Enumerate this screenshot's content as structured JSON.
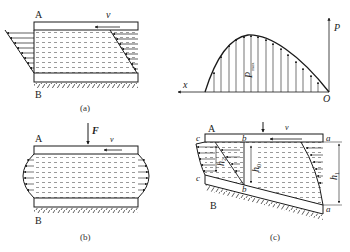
{
  "figure": {
    "panels": [
      {
        "id": "a",
        "caption": "(a)",
        "labels": {
          "upper": "A",
          "lower": "B",
          "velocity": "v"
        },
        "description": "Parallel plates, upper plate moving with velocity v; linear velocity distribution at inlet and outlet"
      },
      {
        "id": "pressure",
        "labels": {
          "x_axis": "x",
          "y_axis": "P",
          "origin": "O",
          "peak": "P_max",
          "peak_main": "P",
          "peak_sub": "max"
        },
        "description": "Pressure distribution along the wedge with peak P_max"
      },
      {
        "id": "b",
        "caption": "(b)",
        "labels": {
          "upper": "A",
          "lower": "B",
          "velocity": "v",
          "force": "F"
        },
        "description": "Squeeze film: load F pushes upper plate, parabolic outflow at both ends"
      },
      {
        "id": "c",
        "caption": "(c)",
        "labels": {
          "upper": "A",
          "lower": "B",
          "velocity": "v",
          "force": "F",
          "sections_top": [
            "c",
            "b",
            "a"
          ],
          "sections_bottom": [
            "c",
            "b",
            "a"
          ],
          "h2": "h",
          "h2_sub": "2",
          "h0": "h",
          "h0_sub": "0",
          "h1": "h",
          "h1_sub": "1"
        },
        "description": "Converging wedge film with inlet height h1, section of max pressure h0, outlet h2"
      }
    ]
  },
  "colors": {
    "line": "#1a1a1a",
    "fluid_dash": "#444444",
    "background": "#ffffff"
  }
}
